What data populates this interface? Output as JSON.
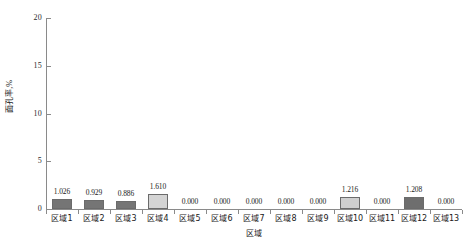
{
  "chart_data": {
    "type": "bar",
    "title": "",
    "xlabel": "区域",
    "ylabel": "面孔率,%",
    "categories": [
      "区域1",
      "区域2",
      "区域3",
      "区域4",
      "区域5",
      "区域6",
      "区域7",
      "区域8",
      "区域9",
      "区域10",
      "区域11",
      "区域12",
      "区域13"
    ],
    "values": [
      1.026,
      0.929,
      0.886,
      1.61,
      0.0,
      0.0,
      0.0,
      0.0,
      0.0,
      1.216,
      0.0,
      1.208,
      0.0
    ],
    "value_labels": [
      "1.026",
      "0.929",
      "0.886",
      "1.610",
      "0.000",
      "0.000",
      "0.000",
      "0.000",
      "0.000",
      "1.216",
      "0.000",
      "1.208",
      "0.000"
    ],
    "bar_colors": [
      "#757575",
      "#757575",
      "#757575",
      "#d4d4d4",
      "#757575",
      "#757575",
      "#757575",
      "#757575",
      "#757575",
      "#cfcfcf",
      "#757575",
      "#6e6e6e",
      "#757575"
    ],
    "ylim": [
      0,
      20
    ],
    "yticks": [
      0,
      5,
      10,
      15,
      20
    ],
    "ytick_labels": [
      "0",
      "5",
      "10",
      "15",
      "20"
    ],
    "grid": false,
    "legend": null,
    "axis_color": "#8a8a8a"
  }
}
